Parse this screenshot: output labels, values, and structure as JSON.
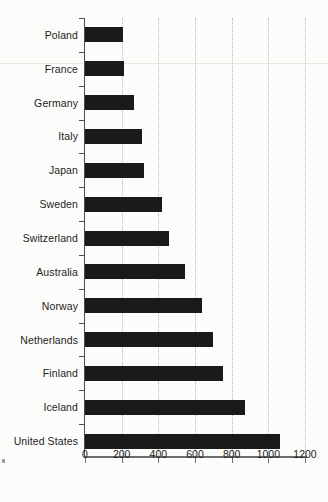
{
  "chart_data": {
    "type": "bar",
    "orientation": "horizontal",
    "title": "",
    "subtitle": "",
    "xlabel": "",
    "ylabel": "",
    "categories": [
      "Poland",
      "France",
      "Germany",
      "Italy",
      "Japan",
      "Sweden",
      "Switzerland",
      "Australia",
      "Norway",
      "Netherlands",
      "Finland",
      "Iceland",
      "United States"
    ],
    "values": [
      205,
      215,
      265,
      310,
      320,
      420,
      460,
      545,
      640,
      700,
      750,
      870,
      1065
    ],
    "xlim": [
      0,
      1200
    ],
    "xticks": [
      0,
      200,
      400,
      600,
      800,
      1000,
      1200
    ],
    "xtick_labels": [
      "0",
      "200",
      "400",
      "600",
      "800",
      "1000",
      "1200"
    ],
    "grid": "vertical-dotted",
    "legend": "none",
    "bar_color": "#1a1a1a",
    "axis_color": "#4d4d4d",
    "grid_color": "#b9b9b4",
    "background_color": "#fcfcfa"
  }
}
